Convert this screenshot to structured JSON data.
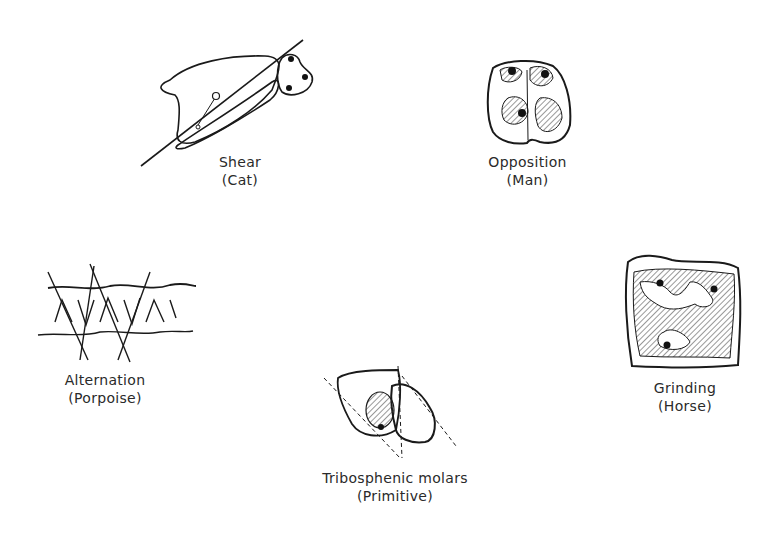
{
  "diagram": {
    "background": "#ffffff",
    "ink": "#1a1a1a",
    "panels": [
      {
        "id": "shear",
        "title": "Shear",
        "subtitle": "(Cat)"
      },
      {
        "id": "opposition",
        "title": "Opposition",
        "subtitle": "(Man)"
      },
      {
        "id": "alternation",
        "title": "Alternation",
        "subtitle": "(Porpoise)"
      },
      {
        "id": "grinding",
        "title": "Grinding",
        "subtitle": "(Horse)"
      },
      {
        "id": "tribosphenic",
        "title": "Tribosphenic molars",
        "subtitle": "(Primitive)"
      }
    ]
  }
}
